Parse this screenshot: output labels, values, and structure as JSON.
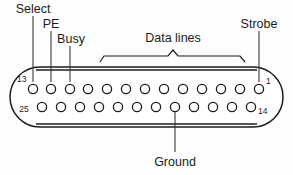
{
  "diagram": {
    "background_color": "#fdfdfd",
    "line_color": "#1b1b1b",
    "labels": {
      "select": "Select",
      "pe": "PE",
      "busy": "Busy",
      "data_lines": "Data lines",
      "strobe": "Strobe",
      "ground": "Ground"
    },
    "pin_numbers": {
      "top_left": "13",
      "top_right": "1",
      "bottom_left": "25",
      "bottom_right": "14"
    },
    "rows": {
      "top_row_count": 13,
      "bottom_row_count": 12,
      "top_row_pins": [
        13,
        12,
        11,
        10,
        9,
        8,
        7,
        6,
        5,
        4,
        3,
        2,
        1
      ],
      "bottom_row_pins": [
        25,
        24,
        23,
        22,
        21,
        20,
        19,
        18,
        17,
        16,
        15,
        14
      ]
    },
    "annotations": [
      {
        "label": "Select",
        "target_pin": 12,
        "side": "top"
      },
      {
        "label": "PE",
        "target_pin": 11,
        "side": "top"
      },
      {
        "label": "Busy",
        "target_pin": 10,
        "side": "top"
      },
      {
        "label": "Data lines",
        "target_pins": [
          9,
          8,
          7,
          6,
          5,
          4,
          3,
          2
        ],
        "side": "top"
      },
      {
        "label": "Strobe",
        "target_pin": 1,
        "side": "top"
      },
      {
        "label": "Ground",
        "target_pin": 19,
        "side": "bottom"
      }
    ]
  }
}
